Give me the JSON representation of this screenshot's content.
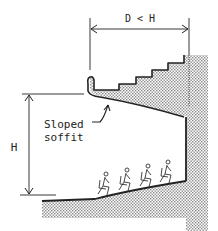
{
  "diagram": {
    "dimension_top": "D < H",
    "dimension_left": "H",
    "annotation": {
      "line1": "Sloped",
      "line2": "soffit"
    },
    "seated_figures": 4,
    "colors": {
      "ink": "#222222",
      "hatch": "#9a9a9a",
      "background": "#ffffff"
    }
  }
}
